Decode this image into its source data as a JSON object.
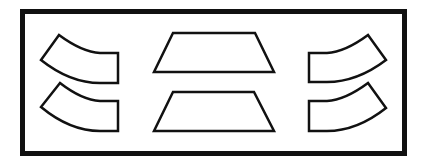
{
  "diagram": {
    "background": "#ffffff",
    "stroke": "#111111",
    "frame": {
      "x": 22.5,
      "y": 11.5,
      "width": 382,
      "height": 142,
      "stroke_width": 5
    },
    "shape_stroke_width": 2.5,
    "shapes": [
      {
        "name": "left-top-curved-tile",
        "path": "M59,35 L41,60 Q70,83 100,83 L118,83 L118,53 L100,53 Q82,52 59,35 Z"
      },
      {
        "name": "left-bottom-curved-tile",
        "path": "M60,83 L41,107 Q70,131 100,131 L118,131 L118,101 L100,101 Q82,100 60,83 Z"
      },
      {
        "name": "center-top-trapezoid",
        "path": "M173,33 L255,33 L274,72 L154,72 Z"
      },
      {
        "name": "center-bottom-trapezoid",
        "path": "M173,92 L254,92 L274,131 L154,131 Z"
      },
      {
        "name": "right-top-curved-tile",
        "path": "M368,35 L386,60 Q357,82 327,82 L309,82 L309,53 L327,53 Q345,52 368,35 Z"
      },
      {
        "name": "right-bottom-curved-tile",
        "path": "M368,83 L386,108 Q357,131 327,131 L309,131 L309,101 L327,101 Q345,100 368,83 Z"
      }
    ]
  }
}
